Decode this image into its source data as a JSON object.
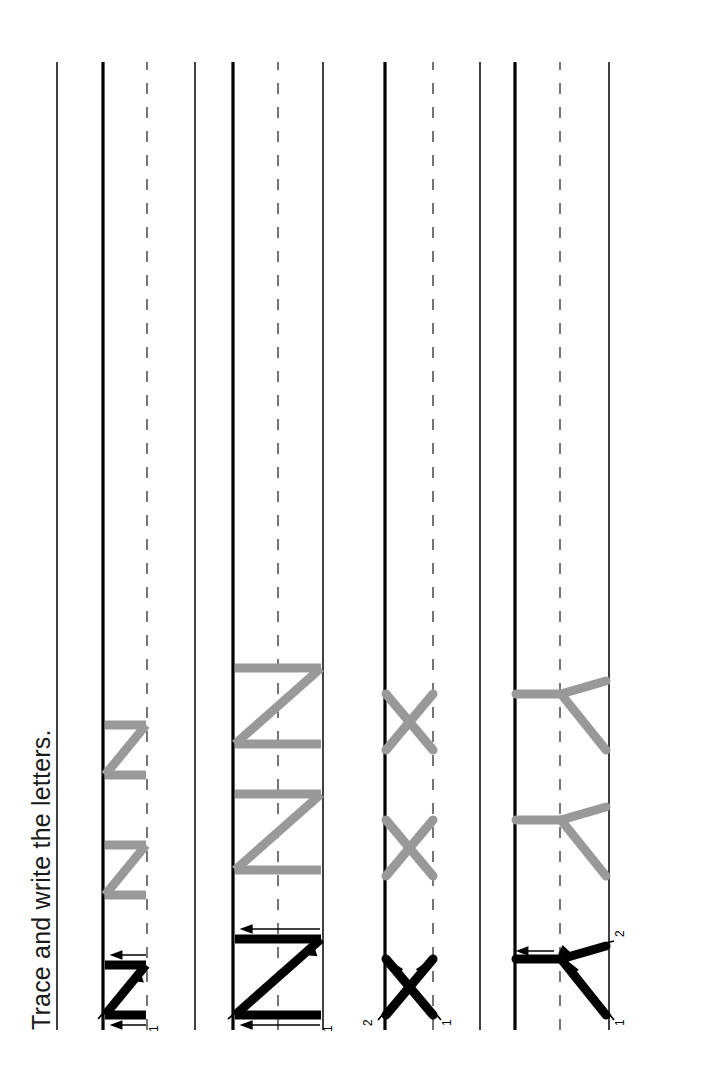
{
  "page": {
    "title": "Trace and write the letters.",
    "background_color": "#ffffff",
    "orientation": "landscape-rotated-90ccw",
    "width": 705,
    "height": 1077
  },
  "colors": {
    "trace_gray": "#999999",
    "model_black": "#000000",
    "rule_line": "#111111",
    "baseline": "#000000",
    "dashed_midline": "#555555",
    "text": "#1a1a1a"
  },
  "guide_lines": {
    "topline_label": "top-line",
    "midline_label": "dashed-mid-line",
    "baseline_label": "baseline",
    "start_y": 62,
    "end_y": 1030
  },
  "rows": [
    {
      "index": 1,
      "letter": "Y",
      "letter_case": "uppercase",
      "stroke_numbers": [
        "1",
        "2"
      ],
      "model_count": 1,
      "trace_count": 2,
      "topline_x": 96,
      "midline_x": 145,
      "baseline_x": 190
    },
    {
      "index": 2,
      "letter": "x",
      "letter_case": "lowercase",
      "stroke_numbers": [
        "1",
        "2"
      ],
      "model_count": 1,
      "trace_count": 2,
      "topline_x": 225,
      "midline_x": 272,
      "baseline_x": 320
    },
    {
      "index": 3,
      "letter": "Z",
      "letter_case": "uppercase",
      "stroke_numbers": [
        "1"
      ],
      "model_count": 1,
      "trace_count": 2,
      "topline_x": 382,
      "midline_x": 427,
      "baseline_x": 472
    },
    {
      "index": 4,
      "letter": "z",
      "letter_case": "lowercase",
      "stroke_numbers": [
        "1"
      ],
      "model_count": 1,
      "trace_count": 2,
      "topline_x": 510,
      "midline_x": 558,
      "baseline_x": 602
    }
  ],
  "trailing_line_x": 648
}
